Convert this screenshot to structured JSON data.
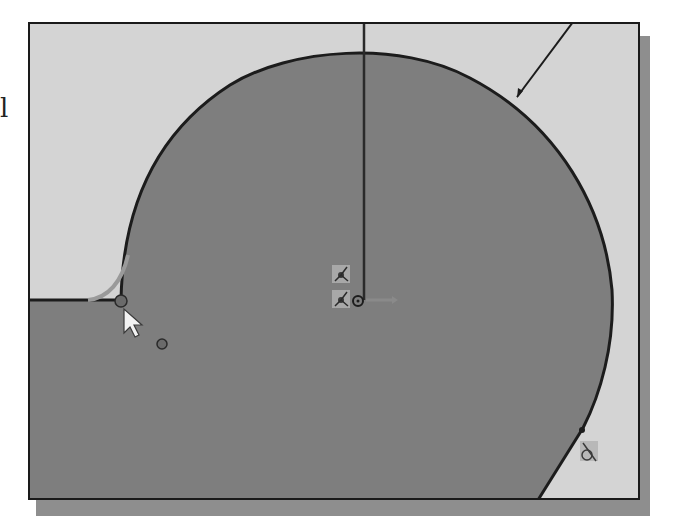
{
  "app": {
    "view": "sketch-graphics-area",
    "stray_text": "l"
  },
  "colors": {
    "background": "#d4d4d4",
    "profile_fill": "#7e7e7e",
    "profile_stroke": "#1c1c1c",
    "highlight_arc": "#9a9a9a",
    "shadow": "#8e8e8e",
    "frame": "#1a1a1a",
    "cursor_fill": "#f2f2f2",
    "endpoint_dot": "#6a6a6a"
  },
  "sketch": {
    "elements": [
      {
        "name": "large-arc-profile",
        "type": "arc"
      },
      {
        "name": "fillet-preview-arc",
        "type": "arc"
      },
      {
        "name": "vertical-construction-line",
        "type": "line"
      },
      {
        "name": "diagonal-leader-line",
        "type": "line"
      },
      {
        "name": "slanted-edge-line",
        "type": "line"
      },
      {
        "name": "bottom-horizontal-line",
        "type": "line"
      }
    ],
    "constraint_icons": [
      {
        "name": "coincident-constraint-icon-1",
        "glyph": "coincident"
      },
      {
        "name": "coincident-constraint-icon-2",
        "glyph": "coincident"
      },
      {
        "name": "tangent-constraint-icon",
        "glyph": "tangent"
      }
    ],
    "origin_marker": "origin-icon",
    "cursor": "arrow-cursor-icon"
  }
}
